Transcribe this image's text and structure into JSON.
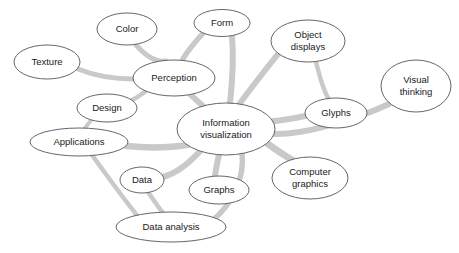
{
  "diagram": {
    "type": "concept-map",
    "canvas": {
      "width": 459,
      "height": 253,
      "background": "#ffffff"
    },
    "style": {
      "edge_color": "#c9c9c9",
      "node_fill": "#ffffff",
      "node_stroke": "#555555",
      "label_color": "#1a1a1a"
    },
    "nodes": [
      {
        "id": "texture",
        "label": "Texture",
        "lines": [
          "Texture"
        ],
        "cx": 47,
        "cy": 62,
        "rx": 33,
        "ry": 17,
        "font_size": 9.5
      },
      {
        "id": "color",
        "label": "Color",
        "lines": [
          "Color"
        ],
        "cx": 127,
        "cy": 29,
        "rx": 30,
        "ry": 16,
        "font_size": 9.5
      },
      {
        "id": "form",
        "label": "Form",
        "lines": [
          "Form"
        ],
        "cx": 222,
        "cy": 23,
        "rx": 28,
        "ry": 13.5,
        "font_size": 9.5
      },
      {
        "id": "object-displays",
        "label": "Object displays",
        "lines": [
          "Object",
          "displays"
        ],
        "cx": 308,
        "cy": 41,
        "rx": 37,
        "ry": 21,
        "font_size": 9.5
      },
      {
        "id": "visual-thinking",
        "label": "Visual thinking",
        "lines": [
          "Visual",
          "thinking"
        ],
        "cx": 416,
        "cy": 86,
        "rx": 35,
        "ry": 26,
        "font_size": 9.5
      },
      {
        "id": "perception",
        "label": "Perception",
        "lines": [
          "Perception"
        ],
        "cx": 174,
        "cy": 78,
        "rx": 41,
        "ry": 18,
        "font_size": 9.5
      },
      {
        "id": "glyphs",
        "label": "Glyphs",
        "lines": [
          "Glyphs"
        ],
        "cx": 336,
        "cy": 113,
        "rx": 31,
        "ry": 15,
        "font_size": 9.5
      },
      {
        "id": "design",
        "label": "Design",
        "lines": [
          "Design"
        ],
        "cx": 107,
        "cy": 108,
        "rx": 30,
        "ry": 14,
        "font_size": 9.5
      },
      {
        "id": "information-visualization",
        "label": "Information visualization",
        "lines": [
          "Information",
          "visualization"
        ],
        "cx": 226,
        "cy": 129,
        "rx": 49,
        "ry": 26,
        "font_size": 9.5
      },
      {
        "id": "applications",
        "label": "Applications",
        "lines": [
          "Applications"
        ],
        "cx": 79,
        "cy": 142,
        "rx": 49,
        "ry": 14,
        "font_size": 9.5
      },
      {
        "id": "computer-graphics",
        "label": "Computer graphics",
        "lines": [
          "Computer",
          "graphics"
        ],
        "cx": 310,
        "cy": 178,
        "rx": 38,
        "ry": 21,
        "font_size": 9.5
      },
      {
        "id": "data",
        "label": "Data",
        "lines": [
          "Data"
        ],
        "cx": 142,
        "cy": 180,
        "rx": 22,
        "ry": 13,
        "font_size": 9.5
      },
      {
        "id": "graphs",
        "label": "Graphs",
        "lines": [
          "Graphs"
        ],
        "cx": 219,
        "cy": 190,
        "rx": 30,
        "ry": 14,
        "font_size": 9.5
      },
      {
        "id": "data-analysis",
        "label": "Data analysis",
        "lines": [
          "Data analysis"
        ],
        "cx": 171,
        "cy": 227,
        "rx": 55,
        "ry": 15,
        "font_size": 9.5
      }
    ],
    "edges": [
      {
        "id": "texture-perception",
        "from": "texture",
        "to": "perception",
        "d": "M 78,69 C 100,78 118,79 134,79",
        "width": 5
      },
      {
        "id": "color-perception",
        "from": "color",
        "to": "perception",
        "d": "M 136,45 C 146,56 156,63 166,61",
        "width": 5
      },
      {
        "id": "form-perception",
        "from": "form",
        "to": "perception",
        "d": "M 205,31 C 195,42 186,52 182,61",
        "width": 5.5
      },
      {
        "id": "perception-infovis",
        "from": "perception",
        "to": "information-visualization",
        "d": "M 190,94 C 198,102 205,108 211,112",
        "width": 6
      },
      {
        "id": "perception-design",
        "from": "perception",
        "to": "design",
        "d": "M 146,91 C 138,97 130,102 124,104",
        "width": 4.5
      },
      {
        "id": "design-applications",
        "from": "design",
        "to": "applications",
        "d": "M 92,119 C 88,124 85,128 83,131",
        "width": 4
      },
      {
        "id": "form-infovis",
        "from": "form",
        "to": "information-visualization",
        "d": "M 232,36 C 234,60 232,85 230,103",
        "width": 6
      },
      {
        "id": "objectdisplays-infovis",
        "from": "object-displays",
        "to": "information-visualization",
        "d": "M 278,54 C 262,74 248,92 238,106",
        "width": 6
      },
      {
        "id": "objectdisplays-glyphs",
        "from": "object-displays",
        "to": "glyphs",
        "d": "M 316,62 C 320,78 325,94 329,99",
        "width": 4.5
      },
      {
        "id": "glyphs-infovis",
        "from": "glyphs",
        "to": "information-visualization",
        "d": "M 305,116 C 290,119 278,121 273,121",
        "width": 6
      },
      {
        "id": "visualthinking-infovis",
        "from": "visual-thinking",
        "to": "information-visualization",
        "d": "M 389,104 C 350,122 300,135 274,134",
        "width": 6
      },
      {
        "id": "infovis-computergraphics",
        "from": "information-visualization",
        "to": "computer-graphics",
        "d": "M 268,144 C 282,154 295,162 302,165",
        "width": 7
      },
      {
        "id": "applications-infovis",
        "from": "applications",
        "to": "information-visualization",
        "d": "M 127,146 C 155,149 185,147 200,142",
        "width": 6.5
      },
      {
        "id": "applications-dataanalysis",
        "from": "applications",
        "to": "data-analysis",
        "d": "M 92,155 C 110,180 128,204 139,218",
        "width": 4.5
      },
      {
        "id": "data-infovis",
        "from": "data",
        "to": "information-visualization",
        "d": "M 163,177 C 180,172 192,160 203,148",
        "width": 6
      },
      {
        "id": "data-dataanalysis",
        "from": "data",
        "to": "data-analysis",
        "d": "M 148,192 C 155,202 160,210 164,214",
        "width": 4.5
      },
      {
        "id": "graphs-infovis",
        "from": "graphs",
        "to": "information-visualization",
        "d": "M 215,176 C 216,168 218,160 219,154",
        "width": 6
      },
      {
        "id": "dataanalysis-infovis",
        "from": "data-analysis",
        "to": "information-visualization",
        "d": "M 213,220 C 232,204 245,178 242,153",
        "width": 5.5
      }
    ]
  }
}
